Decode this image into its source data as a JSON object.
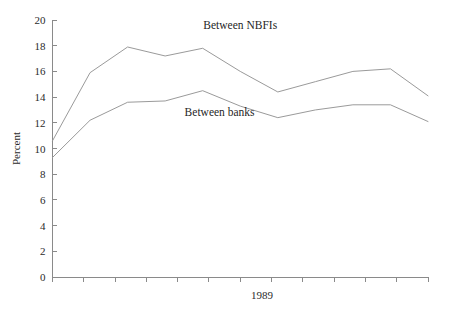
{
  "chart_data": {
    "type": "line",
    "title": "",
    "subtitle": "",
    "xlabel": "1989",
    "ylabel": "Percent",
    "ylim": [
      0,
      20
    ],
    "y_ticks": [
      0,
      2,
      4,
      6,
      8,
      10,
      12,
      14,
      16,
      18,
      20
    ],
    "y_tick_labels": [
      "0",
      "2",
      "4",
      "6",
      "8",
      "10",
      "12",
      "14",
      "16",
      "18",
      "20"
    ],
    "x_tick_count": 13,
    "x_tick_labels": [
      "",
      "",
      "",
      "",
      "",
      "",
      "",
      "",
      "",
      "",
      "",
      "",
      ""
    ],
    "x_axis_center_label": "1989",
    "grid": false,
    "legend": "inline-annotations",
    "x": [
      1,
      2,
      3,
      4,
      5,
      6,
      7,
      8,
      9,
      10,
      11
    ],
    "series": [
      {
        "name": "Between NBFIs",
        "color": "#9a9a9a",
        "values": [
          10.6,
          15.9,
          17.9,
          17.2,
          17.8,
          16.0,
          14.4,
          15.2,
          16.0,
          16.2,
          14.1
        ],
        "label_x": 5.0,
        "label_y": 19.3
      },
      {
        "name": "Between banks",
        "color": "#9a9a9a",
        "values": [
          9.3,
          12.2,
          13.6,
          13.7,
          14.5,
          13.3,
          12.4,
          13.0,
          13.4,
          13.4,
          12.1
        ],
        "label_x": 4.45,
        "label_y": 12.55
      }
    ],
    "annotations": [
      {
        "text": "Between NBFIs"
      },
      {
        "text": "Between banks"
      }
    ],
    "axis_color": "#8a8a8a",
    "background_color": "#ffffff"
  }
}
